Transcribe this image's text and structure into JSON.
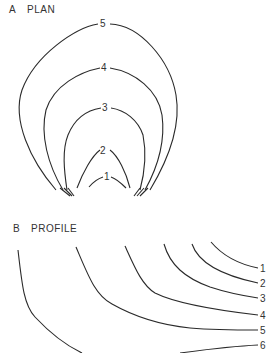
{
  "panel_a": {
    "letter": "A",
    "title": "PLAN",
    "contours": [
      {
        "label": "1"
      },
      {
        "label": "2"
      },
      {
        "label": "3"
      },
      {
        "label": "4"
      },
      {
        "label": "5"
      }
    ]
  },
  "panel_b": {
    "letter": "B",
    "title": "PROFILE",
    "contours": [
      {
        "label": "1"
      },
      {
        "label": "2"
      },
      {
        "label": "3"
      },
      {
        "label": "4"
      },
      {
        "label": "5"
      },
      {
        "label": "6"
      }
    ]
  },
  "colors": {
    "line": "#2a2a2a",
    "background": "#ffffff"
  }
}
